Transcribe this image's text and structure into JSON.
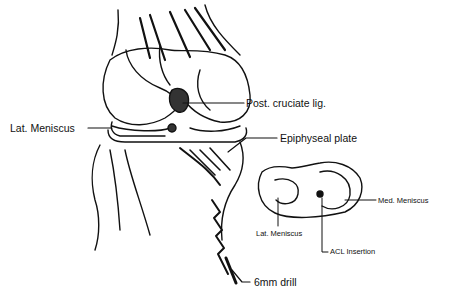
{
  "figure": {
    "labels": {
      "post_cruciate": "Post. cruciate lig.",
      "lat_meniscus_main": "Lat. Meniscus",
      "epiphyseal_plate": "Epiphyseal plate",
      "med_meniscus": "Med. Meniscus",
      "lat_meniscus_inset": "Lat. Meniscus",
      "acl_insertion": "ACL Insertion",
      "drill": "6mm drill"
    }
  }
}
